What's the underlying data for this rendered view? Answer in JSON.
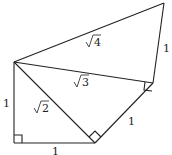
{
  "diagram": {
    "stroke_color": "#222222",
    "background": "#ffffff",
    "points": {
      "A": [
        14,
        62
      ],
      "B": [
        14,
        143
      ],
      "C": [
        95,
        143
      ],
      "D": [
        153,
        83
      ],
      "E": [
        164,
        3
      ]
    },
    "segments": [
      {
        "from": "A",
        "to": "B",
        "label": "1"
      },
      {
        "from": "B",
        "to": "C",
        "label": "1"
      },
      {
        "from": "A",
        "to": "C",
        "label": "√2"
      },
      {
        "from": "C",
        "to": "D",
        "label": "1"
      },
      {
        "from": "A",
        "to": "D",
        "label": "√3"
      },
      {
        "from": "D",
        "to": "E",
        "label": "1"
      },
      {
        "from": "A",
        "to": "E",
        "label": "√4"
      }
    ],
    "labels": {
      "ab": "1",
      "bc": "1",
      "ac_radicand": "2",
      "cd": "1",
      "ad_radicand": "3",
      "de": "1",
      "ae_radicand": "4"
    },
    "right_angles": [
      "B",
      "C",
      "D"
    ]
  }
}
